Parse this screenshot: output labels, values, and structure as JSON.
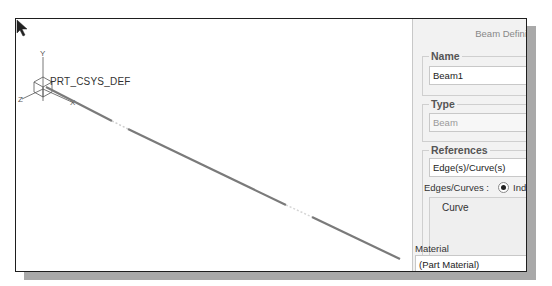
{
  "viewport": {
    "csys_label": "PRT_CSYS_DEF",
    "axes": {
      "x": "X",
      "y": "Y",
      "z": "Z"
    }
  },
  "panel": {
    "title": "Beam Defini",
    "name_group": {
      "legend": "Name",
      "value": "Beam1"
    },
    "type_group": {
      "legend": "Type",
      "value": "Beam"
    },
    "references_group": {
      "legend": "References",
      "selector_value": "Edge(s)/Curve(s)",
      "edges_label": "Edges/Curves :",
      "radio_label": "Indi",
      "list_items": [
        "Curve"
      ]
    },
    "material": {
      "label": "Material",
      "value": "(Part Material)"
    }
  },
  "colors": {
    "beam_line": "#7a7a7a",
    "frame_border": "#1e1e1e",
    "shadow": "#a9a9a9",
    "panel_bg": "#f2f2f2"
  }
}
